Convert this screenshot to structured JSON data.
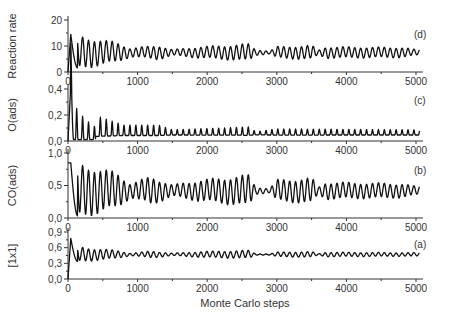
{
  "chart_data": [
    {
      "type": "line",
      "panel": "(d)",
      "ylabel": "Reaction rate",
      "xlabel": "",
      "ylim": [
        0,
        20
      ],
      "yticks": [
        0,
        10,
        20
      ],
      "ytick_labels": [
        "0",
        "10",
        "20"
      ],
      "xlim": [
        0,
        5100
      ],
      "xticks": [
        0,
        1000,
        2000,
        3000,
        4000,
        5000
      ],
      "xtick_labels": [
        "0",
        "1000",
        "2000",
        "3000",
        "4000",
        "5000"
      ],
      "series": [
        {
          "name": "Reaction rate",
          "baseline": 7.5,
          "period": 85,
          "start_value": 0,
          "peak_first": 14.5,
          "envelope": [
            [
              0,
              6.5
            ],
            [
              700,
              3.5
            ],
            [
              900,
              1.5
            ],
            [
              1300,
              2.5
            ],
            [
              1500,
              1.0
            ],
            [
              1900,
              2.0
            ],
            [
              2600,
              3.0
            ],
            [
              2700,
              1.0
            ],
            [
              2900,
              0.5
            ],
            [
              3000,
              2.0
            ],
            [
              3500,
              2.5
            ],
            [
              3600,
              0.8
            ],
            [
              3700,
              2.0
            ],
            [
              4800,
              1.8
            ],
            [
              5000,
              1.0
            ]
          ]
        }
      ]
    },
    {
      "type": "line",
      "panel": "(c)",
      "ylabel": "O(ads)",
      "xlabel": "",
      "ylim": [
        0,
        0.5
      ],
      "yticks": [
        0.0,
        0.2,
        0.4
      ],
      "ytick_labels": [
        "0,0",
        "0,2",
        "0,4"
      ],
      "xlim": [
        0,
        5100
      ],
      "xticks": [
        0,
        1000,
        2000,
        3000,
        4000,
        5000
      ],
      "xtick_labels": [
        "0",
        "1000",
        "2000",
        "3000",
        "4000",
        "5000"
      ],
      "series": [
        {
          "name": "O(ads)",
          "baseline": 0.05,
          "period": 85,
          "start_value": 0,
          "peak_first": 0.42,
          "spiky": true,
          "envelope": [
            [
              0,
              0.2
            ],
            [
              400,
              0.1
            ],
            [
              800,
              0.05
            ],
            [
              1300,
              0.05
            ],
            [
              1500,
              0.025
            ],
            [
              2600,
              0.04
            ],
            [
              2700,
              0.015
            ],
            [
              3000,
              0.03
            ],
            [
              5000,
              0.025
            ]
          ]
        }
      ]
    },
    {
      "type": "line",
      "panel": "(b)",
      "ylabel": "CO(ads)",
      "xlabel": "",
      "ylim": [
        0,
        1.0
      ],
      "yticks": [
        0.0,
        0.5,
        1.0
      ],
      "ytick_labels": [
        "0,0",
        "0,5",
        "1,0"
      ],
      "xlim": [
        0,
        5100
      ],
      "xticks": [
        0,
        1000,
        2000,
        3000,
        4000,
        5000
      ],
      "xtick_labels": [
        "0",
        "1000",
        "2000",
        "3000",
        "4000",
        "5000"
      ],
      "series": [
        {
          "name": "CO(ads)",
          "baseline": 0.42,
          "period": 85,
          "start_value": 0.85,
          "peak_first": 0.85,
          "envelope": [
            [
              0,
              0.42
            ],
            [
              700,
              0.25
            ],
            [
              900,
              0.1
            ],
            [
              1200,
              0.2
            ],
            [
              1500,
              0.08
            ],
            [
              1900,
              0.15
            ],
            [
              2600,
              0.22
            ],
            [
              2700,
              0.05
            ],
            [
              2900,
              0.03
            ],
            [
              3000,
              0.15
            ],
            [
              3500,
              0.18
            ],
            [
              3600,
              0.05
            ],
            [
              3700,
              0.12
            ],
            [
              4800,
              0.1
            ],
            [
              5000,
              0.06
            ]
          ]
        }
      ]
    },
    {
      "type": "line",
      "panel": "(a)",
      "ylabel": "[1x1]",
      "xlabel": "Monte Carlo steps",
      "ylim": [
        0,
        0.9
      ],
      "yticks": [
        0.0,
        0.3,
        0.6,
        0.9
      ],
      "ytick_labels": [
        "0,0",
        "0,3",
        "0,6",
        "0,9"
      ],
      "xlim": [
        0,
        5100
      ],
      "xticks": [
        0,
        1000,
        2000,
        3000,
        4000,
        5000
      ],
      "xtick_labels": [
        "0",
        "1000",
        "2000",
        "3000",
        "4000",
        "5000"
      ],
      "series": [
        {
          "name": "[1x1]",
          "baseline": 0.47,
          "period": 85,
          "start_value": 0,
          "peak_first": 0.78,
          "envelope": [
            [
              0,
              0.15
            ],
            [
              700,
              0.07
            ],
            [
              900,
              0.02
            ],
            [
              1200,
              0.06
            ],
            [
              1500,
              0.02
            ],
            [
              1900,
              0.05
            ],
            [
              2600,
              0.07
            ],
            [
              2700,
              0.01
            ],
            [
              2900,
              0.01
            ],
            [
              3000,
              0.04
            ],
            [
              3500,
              0.05
            ],
            [
              3600,
              0.01
            ],
            [
              3700,
              0.04
            ],
            [
              5000,
              0.03
            ]
          ]
        }
      ]
    }
  ],
  "figure": {
    "xlabel": "Monte Carlo steps",
    "panel_labels": [
      "(d)",
      "(c)",
      "(b)",
      "(a)"
    ]
  }
}
